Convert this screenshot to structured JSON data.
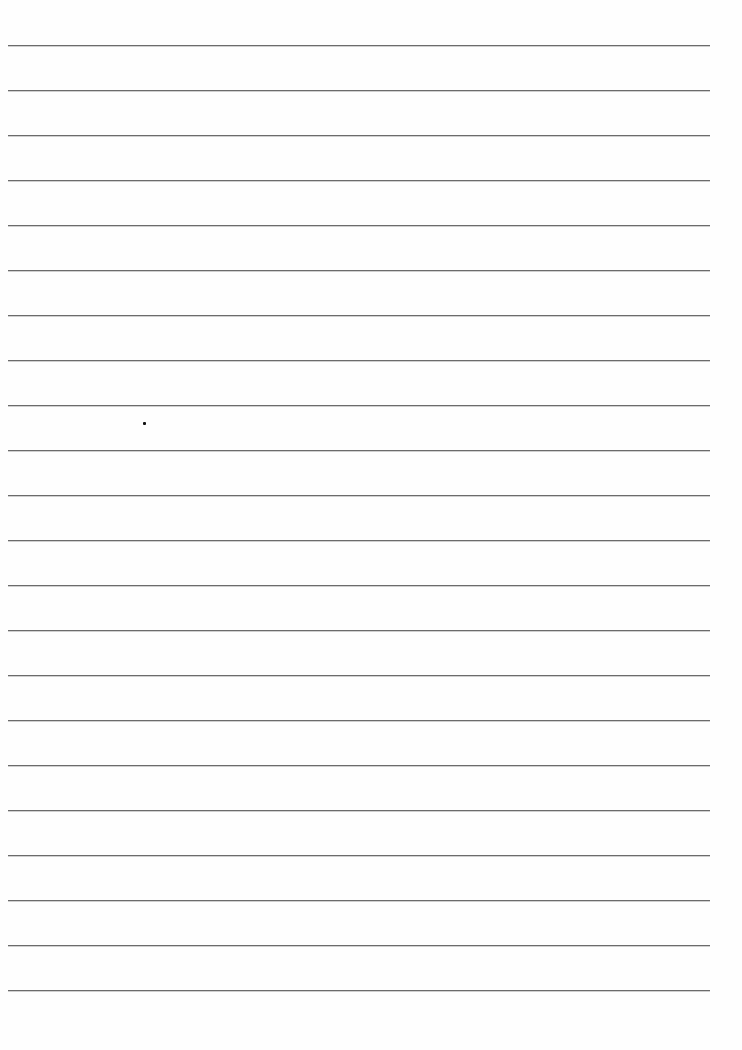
{
  "page": {
    "type": "lined-paper",
    "background_color": "#fefefe",
    "rule_color": "#6b6b6b",
    "rule_count": 22,
    "rule_first_y": 45,
    "rule_spacing": 45,
    "rule_left_x": 8,
    "rule_right_x": 710,
    "marks": [
      {
        "type": "dot",
        "x": 143,
        "y": 422
      }
    ]
  }
}
